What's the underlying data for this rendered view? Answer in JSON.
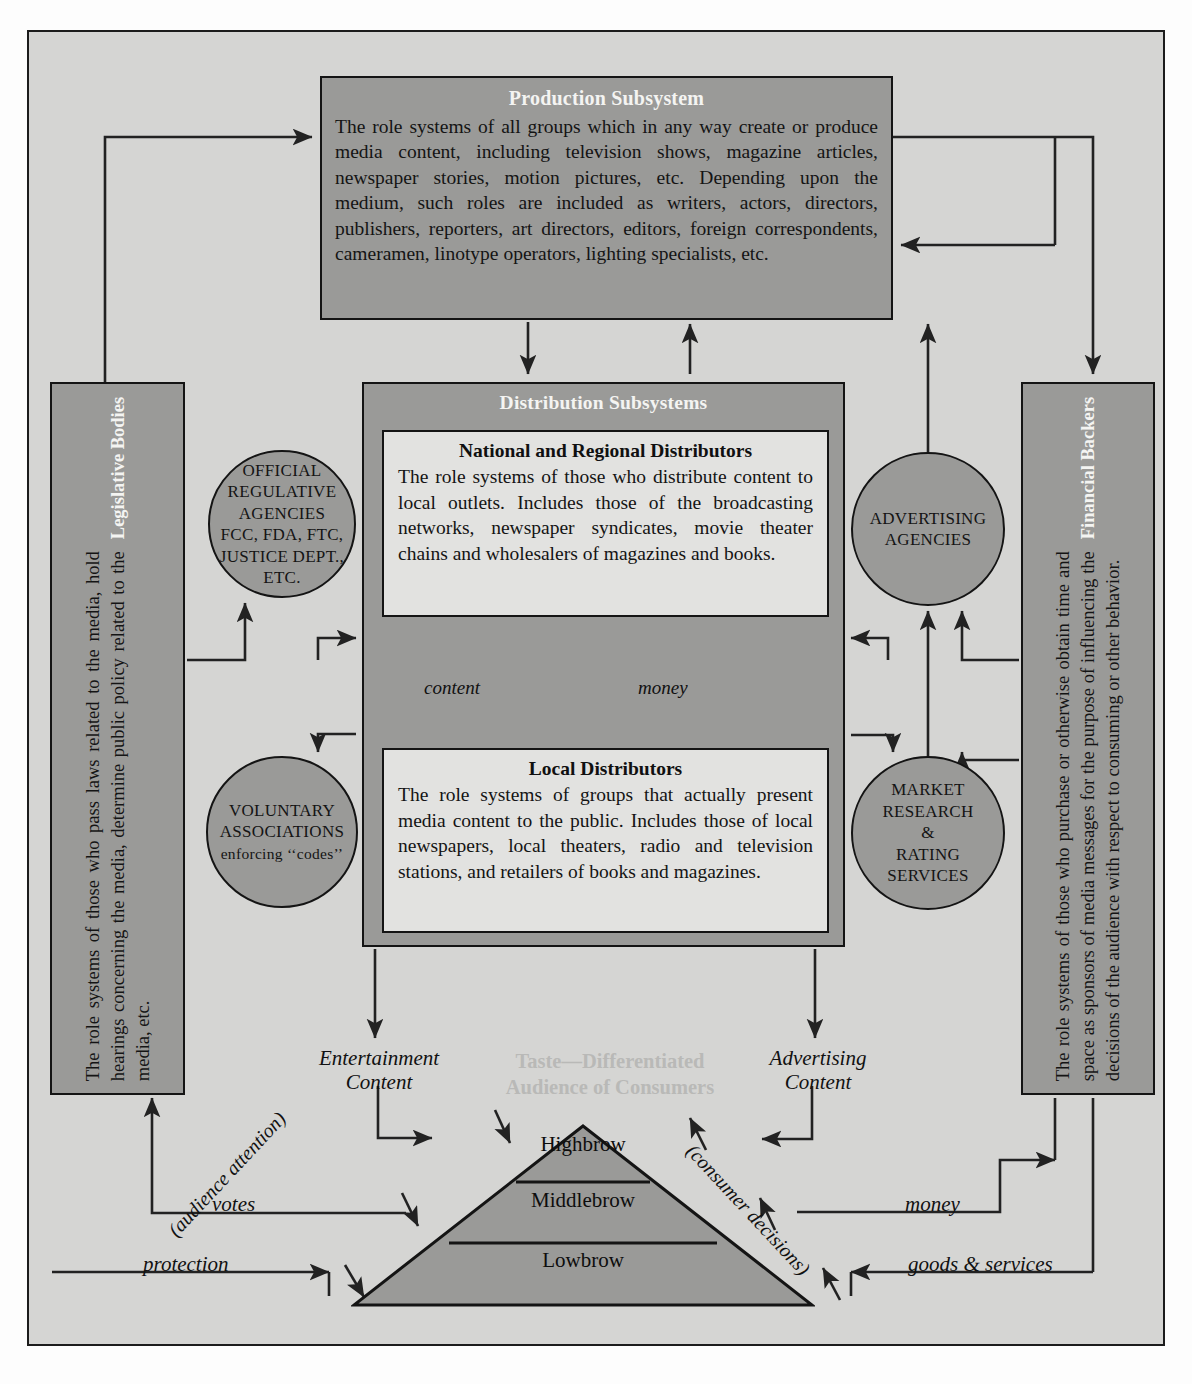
{
  "diagram": {
    "colors": {
      "page_background": "#fdfdfd",
      "frame_background": "#d5d5d3",
      "box_fill": "#9a9a98",
      "card_fill": "#e2e2e0",
      "ink": "#141414",
      "title_text": "#f4f4f2",
      "ghost_text": "#b9b9b7"
    }
  },
  "production": {
    "title": "Production Subsystem",
    "body": "The role systems of all groups which in any way create or produce media content, including television shows, magazine articles, newspaper stories, motion pictures, etc. Depending upon the medium, such roles are included as writers, actors, directors, publishers, reporters, art directors, editors, foreign correspondents, cameramen, linotype operators, lighting specialists, etc."
  },
  "distribution": {
    "title": "Distribution Subsystems",
    "national": {
      "title": "National and Regional Distributors",
      "body": "The role systems of those who distribute content to local outlets. Includes those of the broadcasting networks, newspaper syndicates, movie theater chains and wholesalers of magazines and books."
    },
    "local": {
      "title": "Local Distributors",
      "body": "The role systems of groups that actually present media content to the public. Includes those of local newspapers, local theaters, radio and television stations, and retailers of books and magazines."
    },
    "flow_content": "content",
    "flow_money": "money"
  },
  "legislative": {
    "title": "Legislative Bodies",
    "body": "The role systems of those who pass laws related to the media, hold hearings concerning the media, determine public policy related to the media, etc."
  },
  "financial": {
    "title": "Financial Backers",
    "body": "The role systems of those who purchase or otherwise obtain time and space as sponsors of media messages for the purpose of influencing the decisions of the audience with respect to consuming or other behavior."
  },
  "circles": {
    "official": {
      "line1": "OFFICIAL",
      "line2": "REGULATIVE",
      "line3": "AGENCIES",
      "line4": "FCC, FDA, FTC,",
      "line5": "JUSTICE DEPT.,",
      "line6": "ETC."
    },
    "voluntary": {
      "line1": "VOLUNTARY",
      "line2": "ASSOCIATIONS",
      "line3": "enforcing ‘‘codes’’"
    },
    "advertising": {
      "line1": "ADVERTISING",
      "line2": "AGENCIES"
    },
    "market": {
      "line1": "MARKET",
      "line2": "RESEARCH",
      "line3": "&",
      "line4": "RATING",
      "line5": "SERVICES"
    }
  },
  "audience": {
    "heading": "Taste—Differentiated Audience of Consumers",
    "heading_line1": "Taste—Differentiated",
    "heading_line2": "Audience of Consumers",
    "tiers": [
      {
        "label": "Highbrow"
      },
      {
        "label": "Middlebrow"
      },
      {
        "label": "Lowbrow"
      }
    ]
  },
  "flow_labels": {
    "entertainment_content": "Entertainment Content",
    "entertainment_line1": "Entertainment",
    "entertainment_line2": "Content",
    "advertising_content": "Advertising Content",
    "advertising_line1": "Advertising",
    "advertising_line2": "Content",
    "audience_attention": "(audience attention)",
    "consumer_decisions": "(consumer decisions)",
    "votes": "votes",
    "protection": "protection",
    "money": "money",
    "goods_and_services": "goods & services"
  }
}
